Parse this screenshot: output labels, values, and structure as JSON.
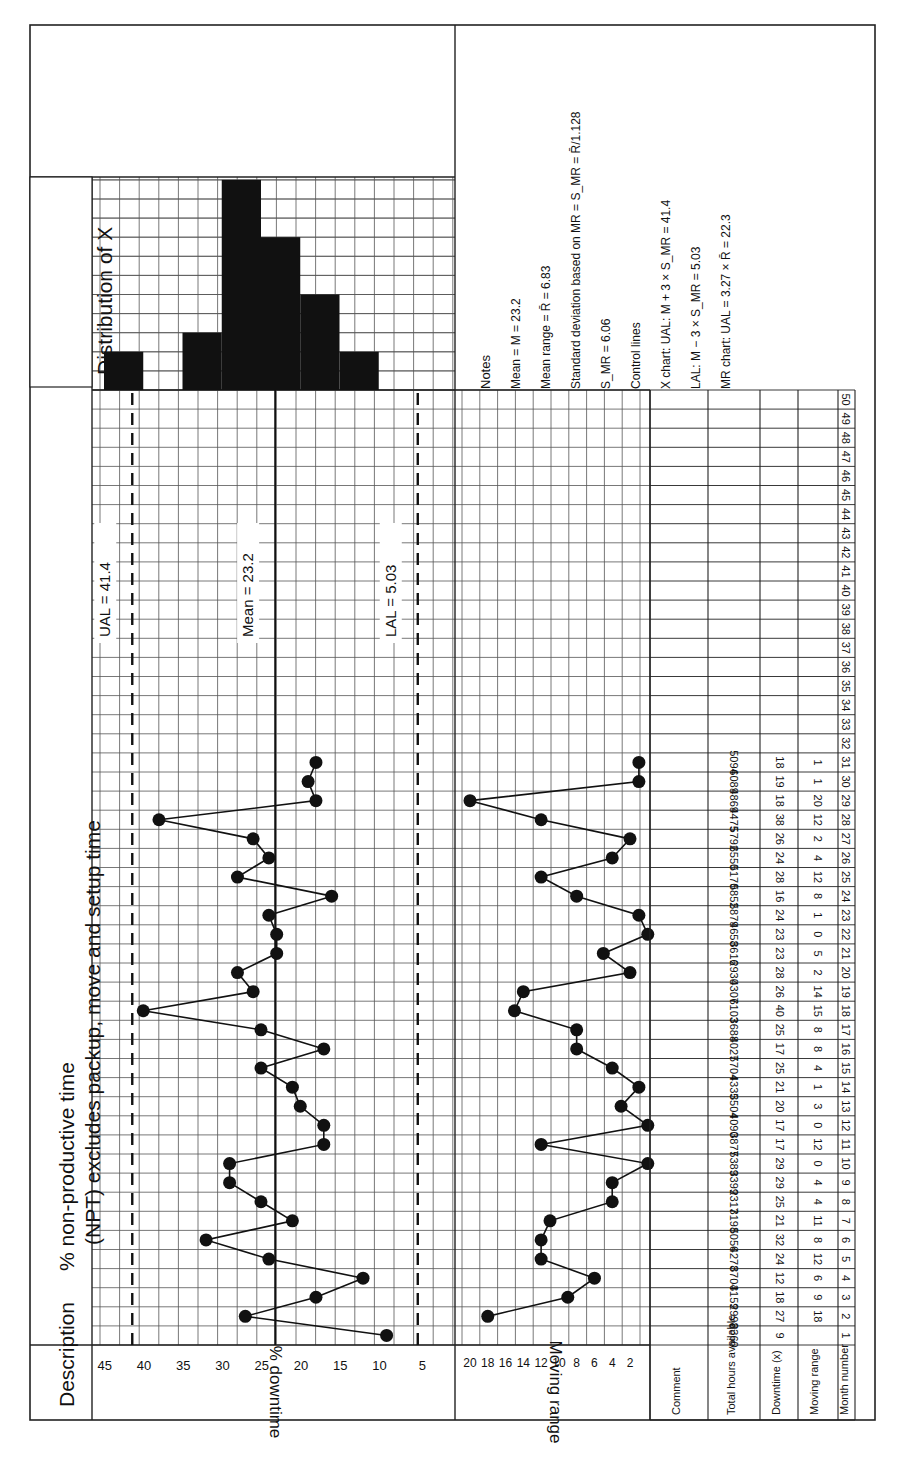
{
  "header": {
    "description_label": "Description",
    "description_line1": "% non-productive time",
    "description_line2": "(NPT) excludes packup, move and setup time",
    "distribution_label": "Distribution of X"
  },
  "caption": "Figure 21.?  XMR chart (partially visible)",
  "notes": {
    "title": "Notes",
    "lines": [
      "Mean = M = 23.2",
      "Mean range = R̄ = 6.83",
      "Standard deviation based on MR = S_MR = R̄/1.128",
      "S_MR = 6.06",
      "Control lines",
      "X chart:   UAL: M + 3 × S_MR = 41.4",
      "LAL: M − 3 × S_MR = 5.03",
      "MR chart: UAL = 3.27 × R̄ = 22.3"
    ]
  },
  "table": {
    "row_labels": [
      "Comment",
      "Total hours available",
      "Downtime (x)",
      "Moving range",
      "Month number"
    ],
    "months": [
      1,
      2,
      3,
      4,
      5,
      6,
      7,
      8,
      9,
      10,
      11,
      12,
      13,
      14,
      15,
      16,
      17,
      18,
      19,
      20,
      21,
      22,
      23,
      24,
      25,
      26,
      27,
      28,
      29,
      30,
      31,
      32,
      33,
      34,
      35,
      36,
      37,
      38,
      39,
      40,
      41,
      42,
      43,
      44,
      45,
      46,
      47,
      48,
      49,
      50
    ],
    "total_hours": [
      2360,
      2998,
      3159,
      3704,
      4278,
      5056,
      3198,
      2317,
      3399,
      5389,
      3877,
      4090,
      3504,
      4335,
      5704,
      4027,
      3688,
      6103,
      4307,
      2930,
      3616,
      4658,
      5879,
      5852,
      5170,
      6550,
      5792,
      4475,
      4869,
      6089,
      5094
    ],
    "downtime": [
      9,
      27,
      18,
      12,
      24,
      32,
      21,
      25,
      29,
      29,
      17,
      17,
      20,
      21,
      25,
      17,
      25,
      40,
      26,
      28,
      23,
      23,
      24,
      16,
      28,
      24,
      26,
      38,
      18,
      19,
      18
    ],
    "moving_range": [
      "",
      18,
      9,
      6,
      12,
      8,
      11,
      4,
      4,
      0,
      12,
      0,
      3,
      1,
      4,
      8,
      8,
      15,
      14,
      2,
      5,
      0,
      1,
      8,
      12,
      4,
      2,
      12,
      20,
      1,
      1
    ]
  },
  "chart_data": [
    {
      "type": "line",
      "title": "X chart",
      "xlabel": "Month number",
      "ylabel": "% downtime",
      "x": [
        1,
        2,
        3,
        4,
        5,
        6,
        7,
        8,
        9,
        10,
        11,
        12,
        13,
        14,
        15,
        16,
        17,
        18,
        19,
        20,
        21,
        22,
        23,
        24,
        25,
        26,
        27,
        28,
        29,
        30,
        31
      ],
      "values": [
        9,
        27,
        18,
        12,
        24,
        32,
        21,
        25,
        29,
        29,
        17,
        17,
        20,
        21,
        25,
        17,
        25,
        40,
        26,
        28,
        23,
        23,
        24,
        16,
        28,
        24,
        26,
        38,
        18,
        19,
        18
      ],
      "yticks": [
        5,
        10,
        15,
        20,
        25,
        30,
        35,
        40,
        45
      ],
      "ylim": [
        0,
        47.5
      ],
      "xlim": [
        1,
        50
      ],
      "reference_lines": [
        {
          "name": "UAL",
          "value": 41.4,
          "label": "UAL = 41.4",
          "style": "dashed"
        },
        {
          "name": "Mean",
          "value": 23.2,
          "label": "Mean = 23.2",
          "style": "solid"
        },
        {
          "name": "LAL",
          "value": 5.03,
          "label": "LAL = 5.03",
          "style": "dashed"
        }
      ],
      "grid": true
    },
    {
      "type": "line",
      "title": "Moving range chart",
      "xlabel": "Month number",
      "ylabel": "Moving range",
      "x": [
        2,
        3,
        4,
        5,
        6,
        7,
        8,
        9,
        10,
        11,
        12,
        13,
        14,
        15,
        16,
        17,
        18,
        19,
        20,
        21,
        22,
        23,
        24,
        25,
        26,
        27,
        28,
        29,
        30,
        31
      ],
      "values": [
        18,
        9,
        6,
        12,
        12,
        11,
        4,
        4,
        0,
        12,
        0,
        3,
        1,
        4,
        8,
        8,
        15,
        14,
        2,
        5,
        0,
        1,
        8,
        12,
        4,
        2,
        12,
        20,
        1,
        1
      ],
      "yticks": [
        2,
        4,
        6,
        8,
        10,
        12,
        14,
        16,
        18,
        20
      ],
      "ylim": [
        0,
        22
      ],
      "grid": true
    },
    {
      "type": "bar",
      "title": "Distribution of X",
      "orientation": "horizontal",
      "categories": [
        "5-10",
        "10-15",
        "15-20",
        "20-25",
        "25-30",
        "30-35",
        "35-40",
        "40-45"
      ],
      "values": [
        0,
        2,
        5,
        8,
        11,
        3,
        0,
        2
      ],
      "note": "Histogram bins aligned with % downtime axis; counts in grid squares"
    }
  ]
}
